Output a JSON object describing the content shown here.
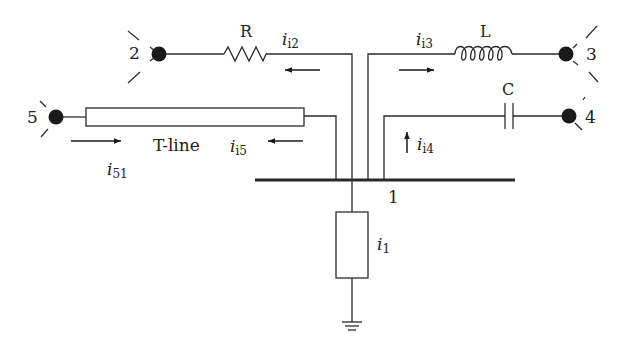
{
  "diagram": {
    "type": "circuit-schematic",
    "colors": {
      "line": "#2a2a2a",
      "node_fill": "#1a1a1a",
      "background": "#ffffff"
    },
    "bus": {
      "label": "1"
    },
    "nodes": [
      {
        "id": "2",
        "label": "2"
      },
      {
        "id": "3",
        "label": "3"
      },
      {
        "id": "4",
        "label": "4"
      },
      {
        "id": "5",
        "label": "5"
      }
    ],
    "components": {
      "resistor": {
        "label": "R"
      },
      "inductor": {
        "label": "L"
      },
      "capacitor": {
        "label": "C"
      },
      "tline": {
        "label": "T-line"
      },
      "load": {
        "label": ""
      }
    },
    "currents": {
      "i_i2": {
        "sym": "i",
        "sub": "i2",
        "direction": "left"
      },
      "i_i3": {
        "sym": "i",
        "sub": "i3",
        "direction": "right"
      },
      "i_i4": {
        "sym": "i",
        "sub": "i4",
        "direction": "up"
      },
      "i_i5": {
        "sym": "i",
        "sub": "i5",
        "direction": "left"
      },
      "i_51": {
        "sym": "i",
        "sub": "51",
        "direction": "right"
      },
      "i_1": {
        "sym": "i",
        "sub": "1",
        "direction": "down"
      }
    }
  }
}
